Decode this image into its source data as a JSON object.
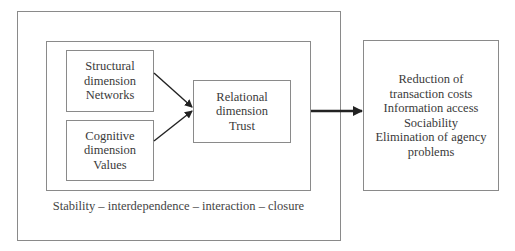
{
  "diagram": {
    "type": "flow",
    "nodes": {
      "structural": {
        "lines": [
          "Structural",
          "dimension",
          "Networks"
        ]
      },
      "cognitive": {
        "lines": [
          "Cognitive",
          "dimension",
          "Values"
        ]
      },
      "relational": {
        "lines": [
          "Relational",
          "dimension",
          "Trust"
        ]
      },
      "outcomes": {
        "lines": [
          "Reduction of",
          "transaction costs",
          "Information access",
          "Sociability",
          "Elimination of agency",
          "problems"
        ]
      }
    },
    "context_caption": "Stability – interdependence – interaction – closure",
    "edges": [
      {
        "from": "structural",
        "to": "relational"
      },
      {
        "from": "cognitive",
        "to": "relational"
      },
      {
        "from": "inner-context",
        "to": "outcomes",
        "style": "thick"
      }
    ],
    "colors": {
      "border": "#8a8a8a",
      "arrow": "#222222",
      "text": "#3a3a3a"
    }
  }
}
